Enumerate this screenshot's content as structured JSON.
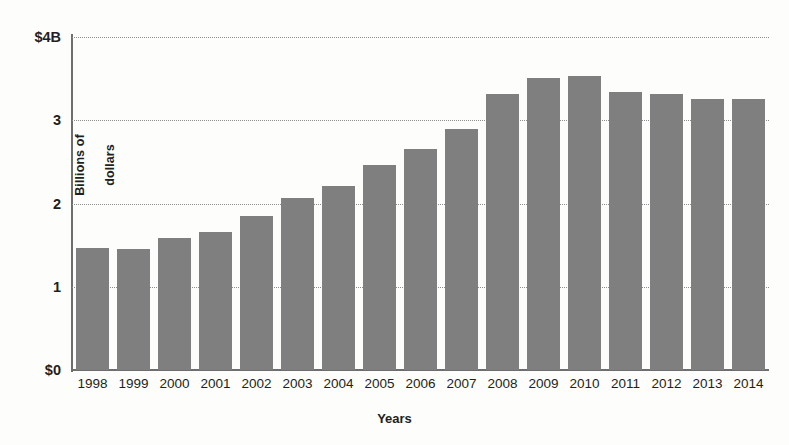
{
  "chart_data": {
    "type": "bar",
    "title": "",
    "subtitle": "",
    "xlabel": "Years",
    "ylabel": "Billions of\ndollars",
    "ylabel_line1": "Billions of",
    "ylabel_line2": "dollars",
    "categories": [
      "1998",
      "1999",
      "2000",
      "2001",
      "2002",
      "2003",
      "2004",
      "2005",
      "2006",
      "2007",
      "2008",
      "2009",
      "2010",
      "2011",
      "2012",
      "2013",
      "2014"
    ],
    "values": [
      1.47,
      1.45,
      1.58,
      1.66,
      1.85,
      2.07,
      2.21,
      2.46,
      2.65,
      2.89,
      3.31,
      3.51,
      3.53,
      3.34,
      3.31,
      3.25,
      3.25
    ],
    "ylim": [
      0,
      4
    ],
    "yticks": [
      0,
      1,
      2,
      3,
      4
    ],
    "ytick_labels": [
      "$0",
      "1",
      "2",
      "3",
      "$4B"
    ],
    "grid": true,
    "gridlines_at": [
      1,
      2,
      3,
      4
    ],
    "legend": "none",
    "bar_color": "#7f7f7f",
    "axis_color": "#6e6e6e",
    "grid_color": "#8d8d8d",
    "background_color": "#fdfdfc",
    "text_color": "#231f20"
  }
}
